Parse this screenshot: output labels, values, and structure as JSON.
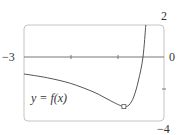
{
  "chart_data": {
    "type": "line",
    "title": "",
    "series": [
      {
        "name": "y = f(x)",
        "x": [
          -3,
          -2.5,
          -2,
          -1.5,
          -1.2,
          -1.0,
          -0.86,
          -0.75,
          -0.65,
          -0.55,
          -0.45,
          -0.39
        ],
        "values": [
          -1.06,
          -1.3,
          -1.65,
          -2.2,
          -2.65,
          -2.95,
          -3.1,
          -3.0,
          -2.5,
          -1.5,
          0.0,
          2.0
        ]
      }
    ],
    "xlim": [
      -3,
      0
    ],
    "ylim": [
      -4,
      2
    ],
    "x_ticks": [
      -3,
      -2,
      -1,
      0
    ],
    "y_ticks": [
      2,
      0,
      -2,
      -4
    ],
    "marked_point": {
      "x": -0.86,
      "y": -3.1,
      "note": "local minimum marked with small square"
    },
    "grid": false,
    "legend": "inline label"
  },
  "labels": {
    "x_left": "−3",
    "x_right": "0",
    "y_top": "2",
    "y_bottom": "−4",
    "function": "y = f(x)"
  },
  "colors": {
    "curve": "#555555",
    "axis": "#777777",
    "frame": "#bbbbbb"
  }
}
